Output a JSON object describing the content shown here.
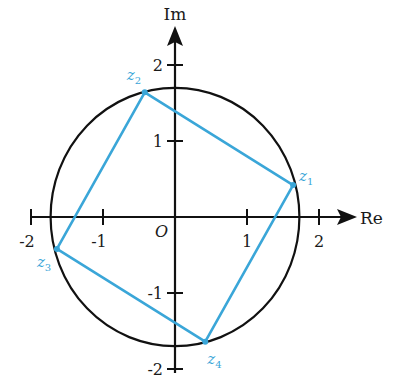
{
  "diagram": {
    "axes": {
      "x_label": "Re",
      "y_label": "Im",
      "origin_label": "O",
      "x_ticks": [
        -2,
        -1,
        1,
        2
      ],
      "y_ticks": [
        2,
        1,
        -1,
        -2
      ],
      "x_tick_labels": [
        "-2",
        "-1",
        "1",
        "2"
      ],
      "y_tick_labels": [
        "2",
        "1",
        "-1",
        "-2"
      ]
    },
    "circle": {
      "center": [
        0,
        0
      ],
      "radius": 1.7
    },
    "points": [
      {
        "name": "z",
        "sub": "1",
        "re": 1.64,
        "im": 0.42
      },
      {
        "name": "z",
        "sub": "2",
        "re": -0.42,
        "im": 1.64
      },
      {
        "name": "z",
        "sub": "3",
        "re": -1.64,
        "im": -0.42
      },
      {
        "name": "z",
        "sub": "4",
        "re": 0.42,
        "im": -1.64
      }
    ],
    "colors": {
      "axis": "#111111",
      "circle": "#111111",
      "square": "#3aa6d8",
      "point_label": "#3aa6d8"
    }
  }
}
